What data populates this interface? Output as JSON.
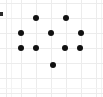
{
  "figure": {
    "title": "",
    "width": 103,
    "height": 97,
    "background_color": "#ffffff",
    "dot_color": "#111111",
    "grid_color": "#ececec",
    "grid_faint_color": "#f3f3f3",
    "edge_tick_color": "#2b2b2b"
  },
  "chart_data": {
    "type": "scatter",
    "title": "",
    "subtitle": "",
    "xlabel": "",
    "ylabel": "",
    "xlim": [
      0,
      103
    ],
    "ylim": [
      0,
      97
    ],
    "grid": true,
    "legend": null,
    "xticklabels": [],
    "yticklabels": [],
    "annotations": [],
    "marker": {
      "shape": "circle",
      "size_px": 6,
      "color": "#111111"
    },
    "point_count": 10,
    "points": [
      {
        "x": 36,
        "y": 18
      },
      {
        "x": 66,
        "y": 18
      },
      {
        "x": 21,
        "y": 33
      },
      {
        "x": 51,
        "y": 33
      },
      {
        "x": 81,
        "y": 33
      },
      {
        "x": 21,
        "y": 48
      },
      {
        "x": 36,
        "y": 48
      },
      {
        "x": 65,
        "y": 48
      },
      {
        "x": 80,
        "y": 48
      },
      {
        "x": 53,
        "y": 65
      }
    ],
    "gridlines": {
      "vertical": [
        6,
        21,
        36,
        51,
        66,
        81,
        96
      ],
      "horizontal": [
        3,
        18,
        33,
        48,
        63,
        78,
        93
      ],
      "vertical_faint": [
        11,
        101
      ],
      "horizontal_faint": [
        88
      ]
    },
    "edge_tick": {
      "x": 0,
      "y": 12
    }
  }
}
